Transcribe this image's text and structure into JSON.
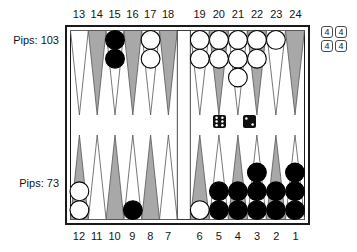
{
  "diagram": {
    "pips_top": "Pips: 103",
    "pips_bottom": "Pips: 73",
    "top_point_numbers": [
      "13",
      "14",
      "15",
      "16",
      "17",
      "18",
      "19",
      "20",
      "21",
      "22",
      "23",
      "24"
    ],
    "bottom_point_numbers": [
      "12",
      "11",
      "10",
      "9",
      "8",
      "7",
      "6",
      "5",
      "4",
      "3",
      "2",
      "1"
    ],
    "dice": [
      6,
      2
    ],
    "dice_tray_values": [
      "4",
      "4",
      "4",
      "4"
    ],
    "checkers": [
      {
        "point": 15,
        "color": "dark",
        "count": 2
      },
      {
        "point": 17,
        "color": "light",
        "count": 2
      },
      {
        "point": 19,
        "color": "light",
        "count": 2
      },
      {
        "point": 20,
        "color": "light",
        "count": 2
      },
      {
        "point": 21,
        "color": "light",
        "count": 3
      },
      {
        "point": 22,
        "color": "light",
        "count": 2
      },
      {
        "point": 23,
        "color": "light",
        "count": 1
      },
      {
        "point": 12,
        "color": "light",
        "count": 2
      },
      {
        "point": 9,
        "color": "dark",
        "count": 1
      },
      {
        "point": 6,
        "color": "light",
        "count": 1
      },
      {
        "point": 5,
        "color": "dark",
        "count": 2
      },
      {
        "point": 4,
        "color": "dark",
        "count": 2
      },
      {
        "point": 3,
        "color": "dark",
        "count": 3
      },
      {
        "point": 2,
        "color": "dark",
        "count": 2
      },
      {
        "point": 1,
        "color": "dark",
        "count": 3
      }
    ],
    "colors": {
      "point_shaded": "#a8a8a8",
      "point_light": "#ffffff",
      "checker_dark": "#000000",
      "checker_light": "#ffffff",
      "die_face": "#111111",
      "die_pip": "#ffffff",
      "frame": "#1a1a1a",
      "triangle_outline": "#555555"
    }
  }
}
